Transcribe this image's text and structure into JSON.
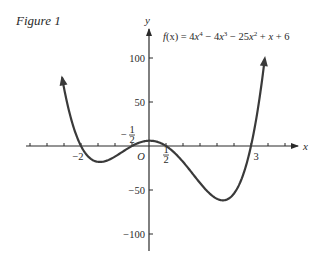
{
  "figure": {
    "label": "Figure 1"
  },
  "chart_data": {
    "type": "line",
    "title": "Figure 1",
    "function_label": "f(x) = 4x^4 - 4x^3 - 25x^2 + x + 6",
    "formula_parts": {
      "f": "f",
      "paren": "(x)",
      "eq": " = 4",
      "x1": "x",
      "p1": "4",
      "t2": " − 4",
      "x2": "x",
      "p2": "3",
      "t3": " − 25",
      "x3": "x",
      "p3": "2",
      "t4": " + ",
      "x4": "x",
      "t5": " + 6"
    },
    "coefficients": [
      4,
      -4,
      -25,
      1,
      6
    ],
    "xlabel": "x",
    "ylabel": "y",
    "xlim": [
      -3.6,
      4.3
    ],
    "ylim": [
      -120,
      132
    ],
    "x_domain_plotted": [
      -2.6,
      3.4
    ],
    "x_ticks_step": 0.5,
    "x_tick_labels": [
      {
        "value": -2,
        "text": "−2"
      },
      {
        "value": 0,
        "text": "O"
      },
      {
        "value": 3,
        "text": "3"
      }
    ],
    "x_fraction_labels": [
      {
        "value": -0.5,
        "num": "1",
        "den": "2",
        "sign": "−",
        "position": "above"
      },
      {
        "value": 0.5,
        "num": "1",
        "den": "2",
        "sign": "",
        "position": "below"
      }
    ],
    "y_tick_labels": [
      {
        "value": 100,
        "text": "100"
      },
      {
        "value": 50,
        "text": "50"
      },
      {
        "value": -50,
        "text": "−50"
      },
      {
        "value": -100,
        "text": "−100"
      }
    ],
    "roots": [
      -2,
      -0.5,
      0.5,
      3
    ],
    "x": [
      -2.6,
      -2.4,
      -2.2,
      -2.0,
      -1.8,
      -1.6,
      -1.4,
      -1.2,
      -1.0,
      -0.8,
      -0.6,
      -0.4,
      -0.2,
      0.0,
      0.2,
      0.4,
      0.6,
      0.8,
      1.0,
      1.2,
      1.4,
      1.6,
      1.8,
      2.0,
      2.2,
      2.4,
      2.6,
      2.8,
      3.0,
      3.2,
      3.4
    ],
    "y": [
      86.22,
      46.27,
      17.93,
      0,
      -9.84,
      -13.02,
      -11.34,
      -6.65,
      -0.95,
      3.89,
      6.45,
      6.12,
      3.32,
      0,
      -1.38,
      -2.15,
      -5.34,
      -13.74,
      -18,
      -26.36,
      -35.66,
      -44.82,
      -51.76,
      -52,
      -44.37,
      -25.97,
      5.23,
      51.55,
      114,
      199.24,
      301.48
    ],
    "legend": [],
    "grid": false,
    "line_color": "#3a3a3a"
  }
}
